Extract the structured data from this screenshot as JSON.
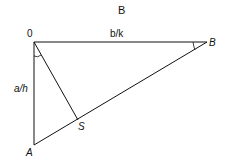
{
  "title": "B",
  "points": {
    "O": {
      "label": "0",
      "x": 34,
      "y": 42
    },
    "B": {
      "label": "B",
      "x": 207,
      "y": 42
    },
    "A": {
      "label": "A",
      "x": 34,
      "y": 145
    },
    "S": {
      "label": "S",
      "x": 78,
      "y": 119
    }
  },
  "edges": {
    "OB": "b/k",
    "OA": "a/h"
  },
  "stroke_color": "#111111"
}
